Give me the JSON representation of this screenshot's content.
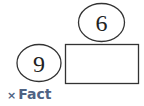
{
  "diagram": {
    "top_oval_value": "6",
    "left_oval_value": "9",
    "answer_box_value": "",
    "operation_symbol": "×",
    "operation_label": "Fact"
  },
  "colors": {
    "stroke": "#333333",
    "caption": "#4f6383"
  }
}
